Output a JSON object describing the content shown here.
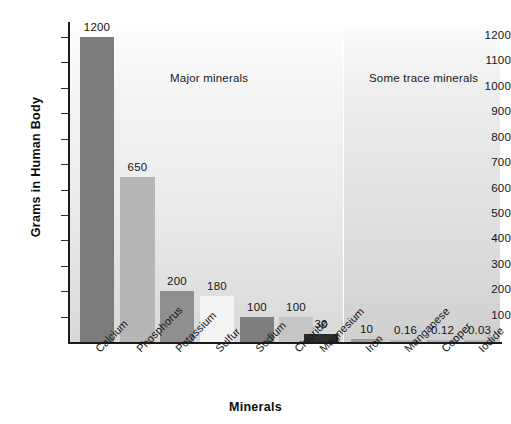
{
  "chart_data": {
    "type": "bar",
    "title": "",
    "xlabel": "Minerals",
    "ylabel": "Grams in Human Body",
    "ylim": [
      0,
      1250
    ],
    "grid": false,
    "legend": "none",
    "yticks": [
      100,
      200,
      300,
      400,
      500,
      600,
      700,
      800,
      900,
      1000,
      1100,
      1200
    ],
    "ytick_labels": [
      "100",
      "200",
      "300",
      "400",
      "500",
      "600",
      "700",
      "800",
      "900",
      "1000",
      "1100",
      "1200"
    ],
    "categories": [
      "Calcium",
      "Phosphorus",
      "Potassium",
      "Sulfur",
      "Sodium",
      "Chloride",
      "Magnesium",
      "Iron",
      "Manganese",
      "Copper",
      "Iodide"
    ],
    "values": [
      1200,
      650,
      200,
      180,
      100,
      100,
      30,
      10,
      0.16,
      0.12,
      0.03
    ],
    "value_labels": [
      "1200",
      "650",
      "200",
      "180",
      "100",
      "100",
      "30",
      "10",
      "0.16",
      "0.12",
      "0.03"
    ],
    "bar_colors": [
      "#7b7b7b",
      "#b6b6b6",
      "#8f8f8f",
      "#f3f3f3",
      "#7e7e7e",
      "#c6c6c6",
      "#2e2e2e",
      "#9a9a9a",
      "#b4b4b4",
      "#b4b4b4",
      "#b4b4b4"
    ],
    "bars": [
      {
        "name": "Calcium",
        "value": 1200,
        "label": "1200",
        "x": 80,
        "width": 34,
        "color": "#7b7b7b"
      },
      {
        "name": "Phosphorus",
        "value": 650,
        "label": "650",
        "x": 120,
        "width": 35,
        "color": "#b6b6b6"
      },
      {
        "name": "Potassium",
        "value": 200,
        "label": "200",
        "x": 160,
        "width": 34,
        "color": "#8f8f8f"
      },
      {
        "name": "Sulfur",
        "value": 180,
        "label": "180",
        "x": 200,
        "width": 34,
        "color": "#f3f3f3"
      },
      {
        "name": "Sodium",
        "value": 100,
        "label": "100",
        "x": 240,
        "width": 34,
        "color": "#7e7e7e"
      },
      {
        "name": "Chloride",
        "value": 100,
        "label": "100",
        "x": 279,
        "width": 34,
        "color": "#c6c6c6"
      },
      {
        "name": "Magnesium",
        "value": 30,
        "label": "30",
        "x": 304,
        "width": 34,
        "color": "#2e2e2e"
      },
      {
        "name": "Iron",
        "value": 10,
        "label": "10",
        "x": 351,
        "width": 31,
        "color": "#9a9a9a"
      },
      {
        "name": "Manganese",
        "value": 0.16,
        "label": "0.16",
        "x": 390,
        "width": 31,
        "color": "#b4b4b4"
      },
      {
        "name": "Copper",
        "value": 0.12,
        "label": "0.12",
        "x": 427,
        "width": 31,
        "color": "#b4b4b4"
      },
      {
        "name": "Iodide",
        "value": 0.03,
        "label": "0.03",
        "x": 464,
        "width": 31,
        "color": "#b4b4b4"
      }
    ],
    "annotations": [
      {
        "name": "major-minerals-note",
        "text": "Major minerals"
      },
      {
        "name": "trace-minerals-note",
        "text": "Some trace minerals"
      }
    ],
    "panels": [
      {
        "name": "major-minerals-panel",
        "label": "Major minerals"
      },
      {
        "name": "trace-minerals-panel",
        "label": "Some trace minerals"
      }
    ]
  }
}
